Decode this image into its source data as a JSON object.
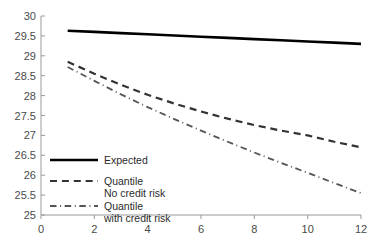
{
  "chart_data": {
    "type": "line",
    "title": "",
    "subtitle": "",
    "xlabel": "",
    "ylabel": "",
    "xlim": [
      0,
      12
    ],
    "ylim": [
      25,
      30
    ],
    "grid": false,
    "legend_position": "inside-lower-left",
    "x_ticks": [
      "0",
      "2",
      "4",
      "6",
      "8",
      "10",
      "12"
    ],
    "x_tick_values": [
      0,
      2,
      4,
      6,
      8,
      10,
      12
    ],
    "y_ticks": [
      "25",
      "25.5",
      "26",
      "26.5",
      "27",
      "27.5",
      "28",
      "28.5",
      "29",
      "29.5",
      "30"
    ],
    "y_tick_values": [
      25,
      25.5,
      26,
      26.5,
      27,
      27.5,
      28,
      28.5,
      29,
      29.5,
      30
    ],
    "x": [
      1,
      2,
      3,
      4,
      5,
      6,
      7,
      8,
      9,
      10,
      11,
      12
    ],
    "series": [
      {
        "name": "Expected",
        "style": "solid",
        "color": "#000000",
        "width": 2.6,
        "values": [
          29.63,
          29.6,
          29.57,
          29.54,
          29.51,
          29.48,
          29.45,
          29.42,
          29.39,
          29.36,
          29.33,
          29.3
        ]
      },
      {
        "name": "Quantile No credit risk",
        "style": "dashed",
        "color": "#333333",
        "width": 2.2,
        "values": [
          28.85,
          28.55,
          28.27,
          28.02,
          27.8,
          27.6,
          27.42,
          27.26,
          27.12,
          27.0,
          26.84,
          26.7
        ]
      },
      {
        "name": "Quantile with credit risk",
        "style": "dashdot",
        "color": "#555555",
        "width": 1.8,
        "values": [
          28.72,
          28.37,
          28.03,
          27.71,
          27.41,
          27.12,
          26.84,
          26.57,
          26.31,
          26.06,
          25.8,
          25.55
        ]
      }
    ],
    "legend": [
      {
        "label_line1": "Expected",
        "label_line2": "",
        "style": "solid"
      },
      {
        "label_line1": "Quantile",
        "label_line2": "No credit risk",
        "style": "dashed"
      },
      {
        "label_line1": "Quantile",
        "label_line2": "with credit risk",
        "style": "dashdot"
      }
    ]
  }
}
